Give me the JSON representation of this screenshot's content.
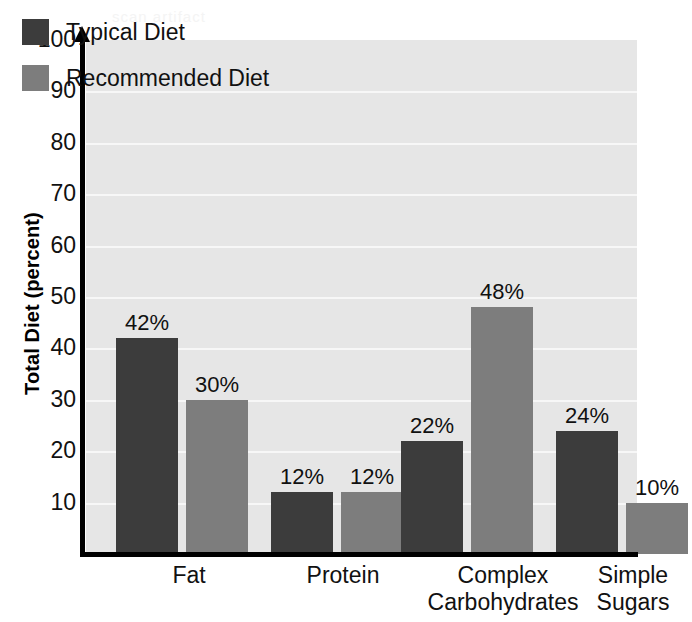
{
  "chart_data": {
    "type": "bar",
    "title": "",
    "xlabel": "",
    "ylabel": "Total Diet (percent)",
    "ylim": [
      0,
      100
    ],
    "ytick_step": 10,
    "yticks": [
      10,
      20,
      30,
      40,
      50,
      60,
      70,
      80,
      90,
      100
    ],
    "grid": true,
    "legend_position": "top-left",
    "categories": [
      "Fat",
      "Protein",
      "Complex Carbohydrates",
      "Simple Sugars"
    ],
    "category_lines": [
      [
        "Fat"
      ],
      [
        "Protein"
      ],
      [
        "Complex",
        "Carbohydrates"
      ],
      [
        "Simple",
        "Sugars"
      ]
    ],
    "series": [
      {
        "name": "Typical Diet",
        "color": "#3c3c3c",
        "values": [
          42,
          12,
          22,
          24
        ],
        "labels": [
          "42%",
          "12%",
          "22%",
          "24%"
        ]
      },
      {
        "name": "Recommended Diet",
        "color": "#7d7d7d",
        "values": [
          30,
          12,
          48,
          10
        ],
        "labels": [
          "30%",
          "12%",
          "48%",
          "10%"
        ]
      }
    ]
  },
  "axis": {
    "y_title": "Total Diet (percent)",
    "y_tick_labels": [
      "100",
      "90",
      "80",
      "70",
      "60",
      "50",
      "40",
      "30",
      "20",
      "10"
    ]
  },
  "legend": {
    "items": [
      {
        "label": "Typical Diet",
        "color": "#3c3c3c"
      },
      {
        "label": "Recommended Diet",
        "color": "#7d7d7d"
      }
    ]
  },
  "colors": {
    "plot_background": "#e6e6e6",
    "grid_line": "#f7f7f7",
    "axis": "#000000",
    "typical_diet": "#3c3c3c",
    "recommended_diet": "#7d7d7d",
    "page_background": "#ffffff"
  },
  "artifact": {
    "ghost_text": "scan artifact"
  }
}
